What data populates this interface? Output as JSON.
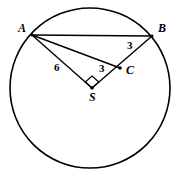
{
  "figure": {
    "kind": "circle-geometry-diagram",
    "background_color": "#ffffff",
    "stroke_color": "#000000",
    "circle": {
      "center_point_label": "S",
      "center_x": 90,
      "center_y": 88,
      "radius": 80
    },
    "points": [
      {
        "name": "A",
        "label": "A",
        "x": 32,
        "y": 35,
        "label_x": 18,
        "label_y": 32
      },
      {
        "name": "B",
        "label": "B",
        "x": 152,
        "y": 36,
        "label_x": 158,
        "label_y": 32
      },
      {
        "name": "C",
        "label": "C",
        "x": 120,
        "y": 68,
        "label_x": 126,
        "label_y": 74
      },
      {
        "name": "S",
        "label": "S",
        "x": 92,
        "y": 88,
        "label_x": 89,
        "label_y": 101
      }
    ],
    "segments": [
      {
        "name": "chord-AB",
        "from": "A",
        "to": "B"
      },
      {
        "name": "segment-AC",
        "from": "A",
        "to": "C"
      },
      {
        "name": "radius-SA",
        "from": "A",
        "to": "S"
      },
      {
        "name": "radius-SB",
        "from": "S",
        "to": "B"
      }
    ],
    "right_angle": {
      "at_point": "S",
      "between": [
        "SA",
        "SB"
      ],
      "marker": "square"
    },
    "measure_labels": [
      {
        "name": "length-SA",
        "text": "6",
        "x": 54,
        "y": 71,
        "describes": "SA"
      },
      {
        "name": "length-SC",
        "text": "3",
        "x": 99,
        "y": 72,
        "describes": "SC"
      },
      {
        "name": "length-CB",
        "text": "3",
        "x": 127,
        "y": 49,
        "describes": "CB"
      }
    ]
  }
}
